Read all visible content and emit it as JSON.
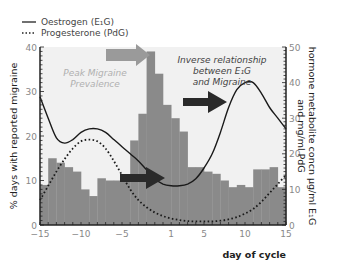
{
  "legend": {
    "oestrogen": "Oestrogen (E₁G)",
    "progesterone": "Progesterone (PdG)"
  },
  "annotations": {
    "peak": [
      "Peak Migraine",
      "Prevalence"
    ],
    "inverse": [
      "Inverse relationship",
      "between E₁G",
      "and Migraine"
    ]
  },
  "colors": {
    "bars": "#8a8a8a",
    "plot_bg": "#f1f1f1",
    "grey_arrow": "#9a9a9a",
    "dark_arrow": "#2a2a2a",
    "annotation_peak": "#b0b0b0",
    "annotation_inverse": "#444444",
    "axis": "#222222",
    "tick_label": "#888888"
  },
  "chart_data": {
    "type": "bar",
    "title": "",
    "xlabel": "day of cycle",
    "ylabel": "% days with reported migraine",
    "y2label": [
      "hormone metabolite concn µg/ml E₁G",
      "and mg/ml PdG"
    ],
    "xlim": [
      -15,
      15
    ],
    "ylim": [
      0,
      40
    ],
    "y2lim": [
      0,
      50
    ],
    "xticks": [
      -15,
      -10,
      -5,
      1,
      5,
      10,
      15
    ],
    "yticks": [
      0,
      10,
      20,
      30,
      40
    ],
    "y2ticks": [
      0,
      10,
      20,
      30,
      40,
      50
    ],
    "grid": false,
    "legend_position": "top-left, outside plot",
    "categories": [
      -15,
      -14,
      -13,
      -12,
      -11,
      -10,
      -9,
      -8,
      -7,
      -6,
      -5,
      -4,
      -3,
      -2,
      -1,
      1,
      2,
      3,
      4,
      5,
      6,
      7,
      8,
      9,
      10,
      11,
      12,
      13,
      14,
      15
    ],
    "series": [
      {
        "name": "% days with reported migraine",
        "type": "bar",
        "axis": "left",
        "values": [
          9,
          15,
          14,
          13,
          12,
          8,
          6.5,
          10.5,
          10,
          10,
          10,
          19,
          25,
          39,
          34,
          27,
          24,
          21,
          13,
          13,
          12,
          11.5,
          10,
          8.5,
          9,
          8.5,
          12.5,
          12.5,
          13,
          8.5
        ]
      },
      {
        "name": "Oestrogen (E₁G)",
        "type": "line",
        "axis": "right",
        "style": "solid",
        "x": [
          -15,
          -14,
          -13,
          -12,
          -11,
          -10,
          -9,
          -8,
          -7,
          -6,
          -5,
          -4,
          -3,
          -2,
          -1,
          0,
          1,
          2,
          3,
          4,
          5,
          6,
          7,
          8,
          9,
          10,
          11,
          12,
          13,
          14,
          15
        ],
        "values": [
          36,
          30,
          24.5,
          23,
          24,
          26,
          27,
          27,
          26,
          24,
          22,
          20,
          18,
          15.5,
          13,
          11.5,
          11,
          11,
          11.5,
          13,
          16,
          20,
          26,
          33,
          38,
          40,
          40,
          37,
          33,
          30,
          27
        ]
      },
      {
        "name": "Progesterone (PdG)",
        "type": "line",
        "axis": "right",
        "style": "dotted",
        "x": [
          -15,
          -14,
          -13,
          -12,
          -11,
          -10,
          -9,
          -8,
          -7,
          -6,
          -5,
          -4,
          -3,
          -2,
          -1,
          0,
          1,
          2,
          3,
          4,
          5,
          6,
          7,
          8,
          9,
          10,
          11,
          12,
          13,
          14,
          15
        ],
        "values": [
          7,
          11,
          15,
          18.5,
          21.5,
          23.5,
          24,
          23.5,
          21.5,
          18,
          14,
          10,
          7,
          5,
          3.5,
          2.5,
          1.8,
          1.4,
          1.1,
          1,
          1,
          1,
          1.2,
          1.6,
          2.2,
          3.2,
          4.5,
          6.5,
          9,
          11.5,
          14
        ]
      }
    ]
  }
}
